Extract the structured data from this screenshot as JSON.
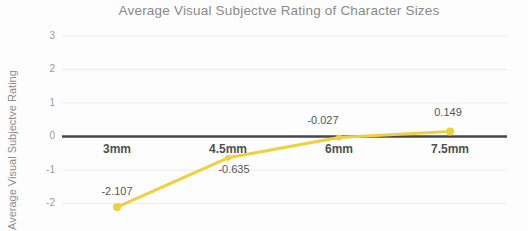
{
  "chart_data": {
    "type": "line",
    "title": "Average Visual Subjectve Rating of Character Sizes",
    "ylabel": "Average Visual Subjectve Rating",
    "xlabel": "",
    "categories": [
      "3mm",
      "4.5mm",
      "6mm",
      "7.5mm"
    ],
    "values": [
      -2.107,
      -0.635,
      -0.027,
      0.149
    ],
    "value_labels": [
      "-2.107",
      "-0.635",
      "-0.027",
      "0.149"
    ],
    "yticks": [
      "3",
      "2",
      "1",
      "0",
      "-1",
      "-2"
    ],
    "ytick_values": [
      3,
      2,
      1,
      0,
      -1,
      -2
    ],
    "ylim": [
      -2.8,
      3.0
    ],
    "grid": true,
    "legend": false,
    "series": [
      {
        "name": "Average Visual Subjectve Rating",
        "values": [
          -2.107,
          -0.635,
          -0.027,
          0.149
        ]
      }
    ],
    "colors": {
      "line": "#f0d03c",
      "point": "#efcf3a",
      "zero_axis": "#474747",
      "gridline": "#ececec",
      "title_text": "#8a8a8a",
      "tick_text": "#9a9a9a",
      "label_text": "#4f4f4f"
    }
  }
}
